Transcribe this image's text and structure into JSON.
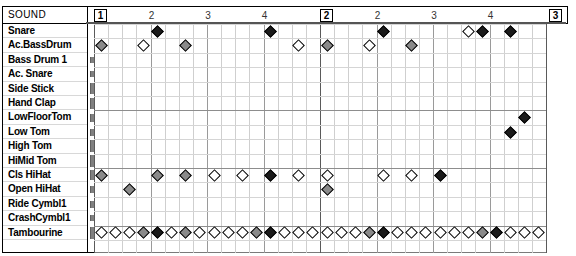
{
  "editor": {
    "title": "Drum Grid Editor",
    "sound_column_header": "SOUND"
  },
  "ruler": {
    "bars": [
      {
        "label": "1",
        "type": "bar"
      },
      {
        "label": "2",
        "type": "beat"
      },
      {
        "label": "3",
        "type": "beat"
      },
      {
        "label": "4",
        "type": "beat"
      },
      {
        "label": "2",
        "type": "bar"
      },
      {
        "label": "2",
        "type": "beat"
      },
      {
        "label": "3",
        "type": "beat"
      },
      {
        "label": "4",
        "type": "beat"
      },
      {
        "label": "3",
        "type": "bar"
      }
    ]
  },
  "tracks": [
    {
      "name": "Snare",
      "level": 0
    },
    {
      "name": "Ac.BassDrum",
      "level": 0
    },
    {
      "name": "Bass Drum 1",
      "level": 6
    },
    {
      "name": "Ac. Snare",
      "level": 6
    },
    {
      "name": "Side Stick",
      "level": 11
    },
    {
      "name": "Hand Clap",
      "level": 11
    },
    {
      "name": "LowFloorTom",
      "level": 8
    },
    {
      "name": "Low Tom",
      "level": 7
    },
    {
      "name": "High Tom",
      "level": 12
    },
    {
      "name": "HiMid Tom",
      "level": 12
    },
    {
      "name": "Cls HiHat",
      "level": 10
    },
    {
      "name": "Open HiHat",
      "level": 7
    },
    {
      "name": "Ride Cymbl1",
      "level": 7
    },
    {
      "name": "CrashCymbl1",
      "level": 6
    },
    {
      "name": "Tambourine",
      "level": 12
    }
  ],
  "chart_data": {
    "type": "table",
    "xlabel": "Time (16th-note steps)",
    "ylabel": "Drum sound",
    "steps_per_bar": 16,
    "bars": 2,
    "total_steps": 32,
    "velocity_legend": {
      "v-hi": "accent (filled black diamond)",
      "v-mid": "medium (gray diamond)",
      "v-lo": "soft (hollow diamond)"
    },
    "categories": [
      "Snare",
      "Ac.BassDrum",
      "Bass Drum 1",
      "Ac. Snare",
      "Side Stick",
      "Hand Clap",
      "LowFloorTom",
      "Low Tom",
      "High Tom",
      "HiMid Tom",
      "Cls HiHat",
      "Open HiHat",
      "Ride Cymbl1",
      "CrashCymbl1",
      "Tambourine"
    ],
    "series": [
      {
        "name": "Snare",
        "notes": [
          {
            "step": 4,
            "v": "v-hi"
          },
          {
            "step": 12,
            "v": "v-hi"
          },
          {
            "step": 20,
            "v": "v-hi"
          },
          {
            "step": 26,
            "v": "v-lo"
          },
          {
            "step": 27,
            "v": "v-hi"
          },
          {
            "step": 29,
            "v": "v-hi"
          }
        ]
      },
      {
        "name": "Ac.BassDrum",
        "notes": [
          {
            "step": 0,
            "v": "v-mid"
          },
          {
            "step": 3,
            "v": "v-lo"
          },
          {
            "step": 6,
            "v": "v-mid"
          },
          {
            "step": 14,
            "v": "v-lo"
          },
          {
            "step": 16,
            "v": "v-mid"
          },
          {
            "step": 19,
            "v": "v-lo"
          },
          {
            "step": 22,
            "v": "v-mid"
          }
        ]
      },
      {
        "name": "Bass Drum 1",
        "notes": []
      },
      {
        "name": "Ac. Snare",
        "notes": []
      },
      {
        "name": "Side Stick",
        "notes": []
      },
      {
        "name": "Hand Clap",
        "notes": []
      },
      {
        "name": "LowFloorTom",
        "notes": [
          {
            "step": 30,
            "v": "v-hi"
          }
        ]
      },
      {
        "name": "Low Tom",
        "notes": [
          {
            "step": 29,
            "v": "v-hi"
          }
        ]
      },
      {
        "name": "High Tom",
        "notes": []
      },
      {
        "name": "HiMid Tom",
        "notes": []
      },
      {
        "name": "Cls HiHat",
        "notes": [
          {
            "step": 0,
            "v": "v-mid"
          },
          {
            "step": 4,
            "v": "v-mid"
          },
          {
            "step": 6,
            "v": "v-mid"
          },
          {
            "step": 8,
            "v": "v-lo"
          },
          {
            "step": 10,
            "v": "v-lo"
          },
          {
            "step": 12,
            "v": "v-hi"
          },
          {
            "step": 14,
            "v": "v-lo"
          },
          {
            "step": 16,
            "v": "v-lo"
          },
          {
            "step": 20,
            "v": "v-lo"
          },
          {
            "step": 22,
            "v": "v-lo"
          },
          {
            "step": 24,
            "v": "v-hi"
          }
        ]
      },
      {
        "name": "Open HiHat",
        "notes": [
          {
            "step": 2,
            "v": "v-mid"
          },
          {
            "step": 16,
            "v": "v-mid"
          }
        ]
      },
      {
        "name": "Ride Cymbl1",
        "notes": []
      },
      {
        "name": "CrashCymbl1",
        "notes": []
      },
      {
        "name": "Tambourine",
        "notes": [
          {
            "step": 0,
            "v": "v-lo"
          },
          {
            "step": 1,
            "v": "v-lo"
          },
          {
            "step": 2,
            "v": "v-lo"
          },
          {
            "step": 3,
            "v": "v-mid"
          },
          {
            "step": 4,
            "v": "v-hi"
          },
          {
            "step": 5,
            "v": "v-lo"
          },
          {
            "step": 6,
            "v": "v-mid"
          },
          {
            "step": 7,
            "v": "v-lo"
          },
          {
            "step": 8,
            "v": "v-lo"
          },
          {
            "step": 9,
            "v": "v-lo"
          },
          {
            "step": 10,
            "v": "v-lo"
          },
          {
            "step": 11,
            "v": "v-mid"
          },
          {
            "step": 12,
            "v": "v-hi"
          },
          {
            "step": 13,
            "v": "v-lo"
          },
          {
            "step": 14,
            "v": "v-lo"
          },
          {
            "step": 15,
            "v": "v-lo"
          },
          {
            "step": 16,
            "v": "v-lo"
          },
          {
            "step": 17,
            "v": "v-lo"
          },
          {
            "step": 18,
            "v": "v-lo"
          },
          {
            "step": 19,
            "v": "v-mid"
          },
          {
            "step": 20,
            "v": "v-hi"
          },
          {
            "step": 21,
            "v": "v-lo"
          },
          {
            "step": 22,
            "v": "v-lo"
          },
          {
            "step": 23,
            "v": "v-lo"
          },
          {
            "step": 24,
            "v": "v-lo"
          },
          {
            "step": 25,
            "v": "v-lo"
          },
          {
            "step": 26,
            "v": "v-lo"
          },
          {
            "step": 27,
            "v": "v-mid"
          },
          {
            "step": 28,
            "v": "v-hi"
          },
          {
            "step": 29,
            "v": "v-lo"
          },
          {
            "step": 30,
            "v": "v-lo"
          },
          {
            "step": 31,
            "v": "v-lo"
          }
        ]
      }
    ]
  }
}
